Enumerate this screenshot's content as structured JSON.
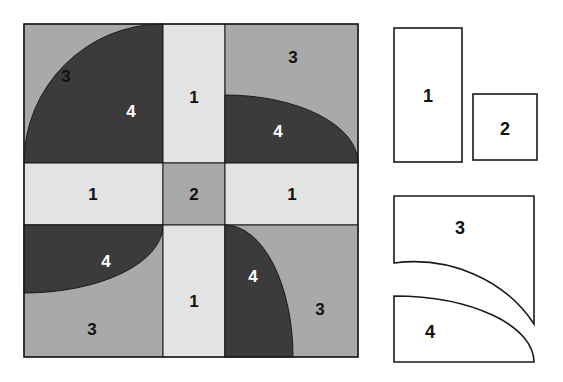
{
  "figure": {
    "background_color": "#ffffff"
  },
  "palette": {
    "piece1_light_gray": "#e3e3e3",
    "piece2_medium_gray": "#a9a9a9",
    "piece3_medium_gray": "#a9a9a9",
    "piece4_dark_gray": "#3b3b3b",
    "outline": "#1a1a1a",
    "label_dark": "#111111",
    "label_light": "#ffffff"
  },
  "grid": {
    "name": "dissection-grid",
    "x": 24,
    "y": 24,
    "width": 334,
    "height": 333,
    "band_start": 163,
    "band_end": 225,
    "cells": [
      {
        "id": "top-left",
        "piece3_label": "3",
        "piece4_label": "4",
        "arc_center": "bottom-left"
      },
      {
        "id": "top-center",
        "piece_label": "1"
      },
      {
        "id": "top-right",
        "piece3_label": "3",
        "piece4_label": "4",
        "arc_center": "bottom-right"
      },
      {
        "id": "middle-left",
        "piece_label": "1"
      },
      {
        "id": "middle-center",
        "piece_label": "2"
      },
      {
        "id": "middle-right",
        "piece_label": "1"
      },
      {
        "id": "bottom-left",
        "piece3_label": "3",
        "piece4_label": "4",
        "arc_center": "top-right"
      },
      {
        "id": "bottom-center",
        "piece_label": "1"
      },
      {
        "id": "bottom-right",
        "piece3_label": "3",
        "piece4_label": "4",
        "arc_center": "top-left"
      }
    ],
    "labels": {
      "tl_3": "3",
      "tl_4": "4",
      "tc_1": "1",
      "tr_3": "3",
      "tr_4": "4",
      "ml_1": "1",
      "mc_2": "2",
      "mr_1": "1",
      "bl_3": "3",
      "bl_4": "4",
      "bc_1": "1",
      "br_3": "3",
      "br_4": "4"
    }
  },
  "legend": {
    "name": "piece-legend",
    "pieces": [
      {
        "id": "piece-1",
        "label": "1",
        "shape": "tall-rectangle",
        "x": 394,
        "y": 28,
        "width": 68,
        "height": 134
      },
      {
        "id": "piece-2",
        "label": "2",
        "shape": "square",
        "x": 473,
        "y": 94,
        "width": 64,
        "height": 66
      },
      {
        "id": "piece-3",
        "label": "3",
        "shape": "square-minus-quarter-circle",
        "x": 394,
        "y": 196,
        "width": 140,
        "height": 128
      },
      {
        "id": "piece-4",
        "label": "4",
        "shape": "quarter-circle",
        "x": 394,
        "y": 296,
        "width": 140,
        "height": 66
      }
    ],
    "labels": {
      "p1": "1",
      "p2": "2",
      "p3": "3",
      "p4": "4"
    }
  }
}
